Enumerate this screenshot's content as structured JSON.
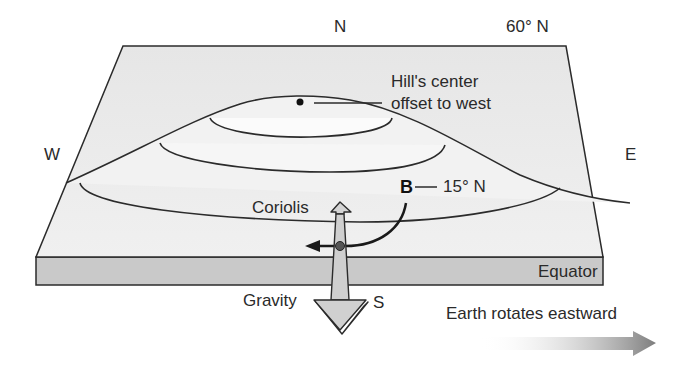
{
  "compass": {
    "north": "N",
    "south": "S",
    "east": "E",
    "west": "W"
  },
  "latitudes": {
    "top_edge": "60° N",
    "point_b": "15° N",
    "bottom_edge": "Equator"
  },
  "labels": {
    "hill_center_line1": "Hill's center",
    "hill_center_line2": "offset to west",
    "point_b": "B",
    "coriolis": "Coriolis",
    "gravity": "Gravity",
    "earth_rotation": "Earth rotates eastward"
  },
  "colors": {
    "surface": "#ececec",
    "hill_inner": "#f9f9f9",
    "slab_side": "#c8c8c8",
    "outline": "#2b2b2b",
    "force_arrow": "#cfcfcf",
    "rotation_arrow": "#8a8a8a"
  }
}
